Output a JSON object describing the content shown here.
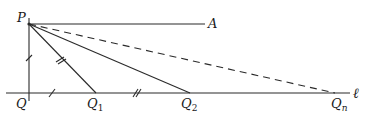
{
  "diagram": {
    "type": "geometry",
    "colors": {
      "stroke": "#2a2a2a",
      "label": "#1a1a1a",
      "background": "#ffffff"
    },
    "points": {
      "P": {
        "label": "P",
        "x": 29,
        "y": 24
      },
      "A": {
        "label": "A",
        "x": 205,
        "y": 24
      },
      "Q": {
        "label": "Q",
        "x": 29,
        "y": 93
      },
      "Q1": {
        "label": "Q",
        "sub": "1",
        "x": 96,
        "y": 93
      },
      "Q2": {
        "label": "Q",
        "sub": "2",
        "x": 190,
        "y": 93
      },
      "Qn": {
        "label": "Q",
        "sub": "n",
        "x": 335,
        "y": 93
      }
    },
    "line_label": "ℓ",
    "segments": [
      {
        "from": "P",
        "to": "A",
        "style": "solid"
      },
      {
        "from": "P",
        "to": "Q",
        "style": "solid",
        "tick": "single"
      },
      {
        "from": "Q",
        "to": "Q1",
        "style": "solid",
        "tick": "single"
      },
      {
        "from": "P",
        "to": "Q1",
        "style": "solid",
        "tick": "double"
      },
      {
        "from": "Q1",
        "to": "Q2",
        "style": "solid",
        "tick": "double"
      },
      {
        "from": "P",
        "to": "Q2",
        "style": "solid"
      },
      {
        "from": "P",
        "to": "Qn",
        "style": "dashed"
      }
    ]
  }
}
